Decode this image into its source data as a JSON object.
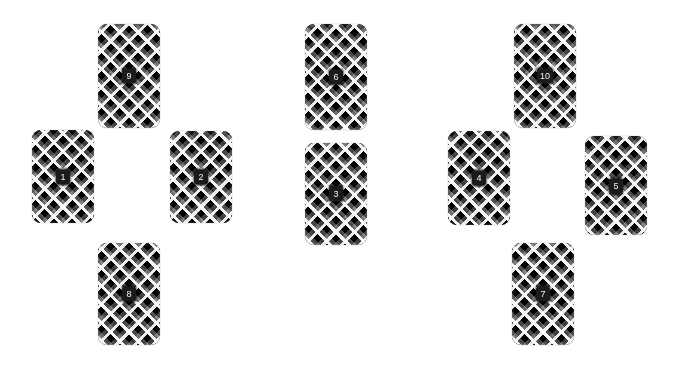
{
  "canvas": {
    "width": 678,
    "height": 373,
    "background_color": "#ffffff"
  },
  "style": {
    "card_fill_description": "diagonal black-and-white plaid weave",
    "card_pattern_colors": [
      "#000000",
      "#7a7a7a",
      "#ffffff"
    ],
    "badge_background_color": "#1b1b1b",
    "badge_text_color": "#f2f2f2",
    "card_corner_radius_px": 9
  },
  "groups": [
    {
      "name": "group-left",
      "arrangement": "diamond",
      "cards": [
        {
          "label": "9",
          "x": 98,
          "y": 24,
          "w": 62,
          "h": 104
        },
        {
          "label": "1",
          "x": 32,
          "y": 130,
          "w": 62,
          "h": 93
        },
        {
          "label": "2",
          "x": 170,
          "y": 131,
          "w": 62,
          "h": 92
        },
        {
          "label": "8",
          "x": 98,
          "y": 243,
          "w": 62,
          "h": 102
        }
      ]
    },
    {
      "name": "group-middle",
      "arrangement": "vertical-pair",
      "cards": [
        {
          "label": "6",
          "x": 305,
          "y": 24,
          "w": 62,
          "h": 106
        },
        {
          "label": "3",
          "x": 305,
          "y": 143,
          "w": 62,
          "h": 102
        }
      ]
    },
    {
      "name": "group-right",
      "arrangement": "diamond",
      "cards": [
        {
          "label": "10",
          "x": 514,
          "y": 24,
          "w": 62,
          "h": 104
        },
        {
          "label": "4",
          "x": 448,
          "y": 131,
          "w": 62,
          "h": 94
        },
        {
          "label": "5",
          "x": 585,
          "y": 136,
          "w": 62,
          "h": 99
        },
        {
          "label": "7",
          "x": 512,
          "y": 243,
          "w": 62,
          "h": 102
        }
      ]
    }
  ]
}
